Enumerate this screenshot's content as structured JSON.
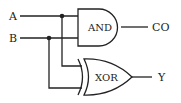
{
  "diagram": {
    "inputs": [
      {
        "id": "A",
        "label": "A"
      },
      {
        "id": "B",
        "label": "B"
      }
    ],
    "gates": [
      {
        "id": "and",
        "type": "AND",
        "label": "AND",
        "inputs": [
          "A",
          "B"
        ],
        "output": "CO"
      },
      {
        "id": "xor",
        "type": "XOR",
        "label": "XOR",
        "inputs": [
          "A",
          "B"
        ],
        "output": "Y"
      }
    ],
    "outputs": [
      {
        "id": "CO",
        "label": "CO"
      },
      {
        "id": "Y",
        "label": "Y"
      }
    ],
    "colors": {
      "stroke": "#222222",
      "background": "#ffffff"
    }
  }
}
